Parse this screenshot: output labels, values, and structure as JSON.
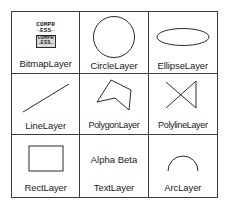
{
  "figure": {
    "kind": "layer-type-legend-grid",
    "columns": 3,
    "rows": 3,
    "border_color": "#3b3b3b",
    "background_color": "#ffffff",
    "stroke_color": "#2a2a2a",
    "text_color": "#1b1b1b"
  },
  "cells": [
    {
      "id": "bitmap-layer",
      "label": "BitmapLayer",
      "icon": "bitmap-compress-icon",
      "icon_text": {
        "line1": "COMPR",
        "line2": "→ESS←",
        "boxed_line1": "COMPR",
        "boxed_line2": "→ESS←"
      }
    },
    {
      "id": "circle-layer",
      "label": "CircleLayer",
      "icon": "circle-shape-icon"
    },
    {
      "id": "ellipse-layer",
      "label": "EllipseLayer",
      "icon": "ellipse-shape-icon"
    },
    {
      "id": "line-layer",
      "label": "LineLayer",
      "icon": "line-shape-icon"
    },
    {
      "id": "polygon-layer",
      "label": "PolygonLayer",
      "icon": "polygon-shape-icon"
    },
    {
      "id": "polyline-layer",
      "label": "PolylineLayer",
      "icon": "polyline-shape-icon"
    },
    {
      "id": "rect-layer",
      "label": "RectLayer",
      "icon": "rectangle-shape-icon"
    },
    {
      "id": "text-layer",
      "label": "TextLayer",
      "icon": "text-sample-icon",
      "sample_text": "Alpha Beta"
    },
    {
      "id": "arc-layer",
      "label": "ArcLayer",
      "icon": "arc-shape-icon"
    }
  ]
}
